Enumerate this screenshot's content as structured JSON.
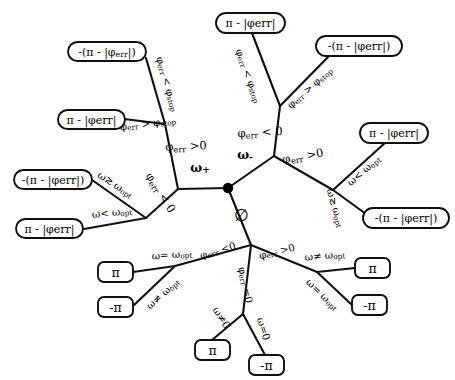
{
  "diagram": {
    "type": "decision-tree",
    "background_color": "#ffffff",
    "line_color": "#101010",
    "text_color": "#000000"
  },
  "root": {
    "name": "root-node",
    "symbol": "•",
    "x": 228,
    "y": 188
  },
  "branches": [
    {
      "label": "ω",
      "sub": "+",
      "name": "omega-plus-label",
      "x": 200,
      "y": 168
    },
    {
      "label": "ω",
      "sub": "-",
      "name": "omega-minus-label",
      "x": 245,
      "y": 155
    },
    {
      "label": "∅",
      "sub": "",
      "name": "empty-set-label",
      "x": 241,
      "y": 215
    }
  ],
  "edge_labels": [
    {
      "id": "e1",
      "text": "φ",
      "sub": "err",
      "tail": " < φ",
      "tail_sub": "stop",
      "name": "edge-label-phierr-lt-phistop-upper-left"
    },
    {
      "id": "e2",
      "text": "φ",
      "sub": "err",
      "tail": " > φ",
      "tail_sub": "stop",
      "name": "edge-label-phierr-gt-phistop-lower-left"
    },
    {
      "id": "e3",
      "text": "φ",
      "sub": "err",
      "tail": " >0",
      "tail_sub": "",
      "name": "edge-label-phierr-gt-0-left"
    },
    {
      "id": "e4",
      "text": "φ",
      "sub": "err",
      "tail": " < 0",
      "tail_sub": "",
      "name": "edge-label-phierr-lt-0-left"
    },
    {
      "id": "e5",
      "text": "ω≳ ω",
      "sub": "opt",
      "tail": "",
      "tail_sub": "",
      "name": "edge-label-omega-gte-omegaopt-left"
    },
    {
      "id": "e6",
      "text": "ω< ω",
      "sub": "opt",
      "tail": "",
      "tail_sub": "",
      "name": "edge-label-omega-lt-omegaopt-left"
    },
    {
      "id": "e7",
      "text": "φ",
      "sub": "err",
      "tail": " < φ",
      "tail_sub": "stop",
      "name": "edge-label-phierr-lt-phistop-top"
    },
    {
      "id": "e8",
      "text": "φ",
      "sub": "err",
      "tail": " > φ",
      "tail_sub": "stop",
      "name": "edge-label-phierr-gt-phistop-top-right"
    },
    {
      "id": "e9",
      "text": "φ",
      "sub": "err",
      "tail": " < 0",
      "tail_sub": "",
      "name": "edge-label-phierr-lt-0-center"
    },
    {
      "id": "e10",
      "text": "φ",
      "sub": "err",
      "tail": " >0",
      "tail_sub": "",
      "name": "edge-label-phierr-gt-0-right"
    },
    {
      "id": "e11",
      "text": "ω< ω",
      "sub": "opt",
      "tail": "",
      "tail_sub": "",
      "name": "edge-label-omega-lt-omegaopt-right"
    },
    {
      "id": "e12",
      "text": "ω≳ ω",
      "sub": "opt",
      "tail": "",
      "tail_sub": "",
      "name": "edge-label-omega-gte-omegaopt-right"
    },
    {
      "id": "e13",
      "text": "φ",
      "sub": "err",
      "tail": " <0",
      "tail_sub": "",
      "name": "edge-label-phierr-lt-0-bottom-left"
    },
    {
      "id": "e14",
      "text": "φ",
      "sub": "err",
      "tail": " >0",
      "tail_sub": "",
      "name": "edge-label-phierr-gt-0-bottom-right"
    },
    {
      "id": "e15",
      "text": "φ",
      "sub": "err",
      "tail": " =0",
      "tail_sub": "",
      "name": "edge-label-phierr-eq-0-bottom"
    },
    {
      "id": "e16",
      "text": "ω= ω",
      "sub": "opt",
      "tail": "",
      "tail_sub": "",
      "name": "edge-label-omega-eq-omegaopt-bottom-left"
    },
    {
      "id": "e17",
      "text": "ω≠ ω",
      "sub": "opt",
      "tail": "",
      "tail_sub": "",
      "name": "edge-label-omega-neq-omegaopt-bottom-left"
    },
    {
      "id": "e18",
      "text": "ω≠0",
      "sub": "",
      "tail": "",
      "tail_sub": "",
      "name": "edge-label-omega-neq-0"
    },
    {
      "id": "e19",
      "text": "ω=0",
      "sub": "",
      "tail": "",
      "tail_sub": "",
      "name": "edge-label-omega-eq-0"
    },
    {
      "id": "e20",
      "text": "ω≠ ω",
      "sub": "opt",
      "tail": "",
      "tail_sub": "",
      "name": "edge-label-omega-neq-omegaopt-bottom-right"
    },
    {
      "id": "e21",
      "text": "ω= ω",
      "sub": "opt",
      "tail": "",
      "tail_sub": "",
      "name": "edge-label-omega-eq-omegaopt-bottom-right"
    }
  ],
  "leaves": [
    {
      "id": "L1",
      "label": "-(π - |φ",
      "sub": "err",
      "tail": "|)",
      "name": "leaf-neg-pi-minus-abs-phierr-upper-left"
    },
    {
      "id": "L2",
      "label": "π - |φerr|",
      "sub": "",
      "tail": "",
      "name": "leaf-pi-minus-abs-phierr-left-upper"
    },
    {
      "id": "L3",
      "label": "-(π - |φerr|)",
      "sub": "",
      "tail": "",
      "name": "leaf-neg-pi-minus-abs-phierr-left-mid"
    },
    {
      "id": "L4",
      "label": "π - |φerr|",
      "sub": "",
      "tail": "",
      "name": "leaf-pi-minus-abs-phierr-left-lower"
    },
    {
      "id": "L5",
      "label": "π - |φerr|",
      "sub": "",
      "tail": "",
      "name": "leaf-pi-minus-abs-phierr-top"
    },
    {
      "id": "L6",
      "label": "-(π - |φerr|)",
      "sub": "",
      "tail": "",
      "name": "leaf-neg-pi-minus-abs-phierr-top-right"
    },
    {
      "id": "L7",
      "label": "π - |φerr|",
      "sub": "",
      "tail": "",
      "name": "leaf-pi-minus-abs-phierr-right-upper"
    },
    {
      "id": "L8",
      "label": "-(π - |φerr|)",
      "sub": "",
      "tail": "",
      "name": "leaf-neg-pi-minus-abs-phierr-right-lower"
    },
    {
      "id": "L9",
      "label": "π",
      "sub": "",
      "tail": "",
      "name": "leaf-pi-bottom-left-upper"
    },
    {
      "id": "L10",
      "label": "-π",
      "sub": "",
      "tail": "",
      "name": "leaf-neg-pi-bottom-left-lower"
    },
    {
      "id": "L11",
      "label": "π",
      "sub": "",
      "tail": "",
      "name": "leaf-pi-bottom-center"
    },
    {
      "id": "L12",
      "label": "-π",
      "sub": "",
      "tail": "",
      "name": "leaf-neg-pi-bottom-center"
    },
    {
      "id": "L13",
      "label": "π",
      "sub": "",
      "tail": "",
      "name": "leaf-pi-bottom-right-upper"
    },
    {
      "id": "L14",
      "label": "-π",
      "sub": "",
      "tail": "",
      "name": "leaf-neg-pi-bottom-right-lower"
    }
  ]
}
